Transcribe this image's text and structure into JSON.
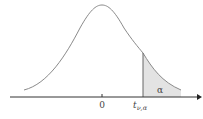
{
  "diagram": {
    "title": "",
    "type": "t-distribution upper tail",
    "labels": {
      "origin": "0",
      "critical_value_main": "t",
      "critical_value_sub": "ν,α",
      "tail_area": "α"
    },
    "colors": {
      "curve": "#8a8a8a",
      "axis": "#333333",
      "shade": "#e3e3e3",
      "text": "#444444"
    }
  }
}
